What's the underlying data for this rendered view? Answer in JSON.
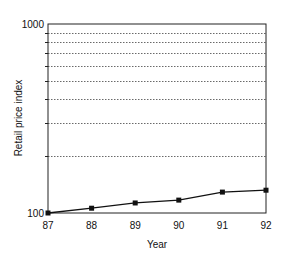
{
  "chart_data": {
    "type": "line",
    "title": "",
    "xlabel": "Year",
    "ylabel": "Retail price index",
    "yscale": "log",
    "ylim": [
      100,
      1000
    ],
    "y_tick_labels": [
      "100",
      "1000"
    ],
    "x_tick_labels": [
      "87",
      "88",
      "89",
      "90",
      "91",
      "92"
    ],
    "gridlines": [
      200,
      300,
      400,
      500,
      600,
      700,
      800,
      900
    ],
    "grid": true,
    "legend": null,
    "series": [
      {
        "name": "Retail price index",
        "x": [
          "87",
          "88",
          "89",
          "90",
          "91",
          "92"
        ],
        "values": [
          100,
          106,
          113,
          117,
          129,
          132
        ],
        "marker": "square"
      }
    ]
  }
}
